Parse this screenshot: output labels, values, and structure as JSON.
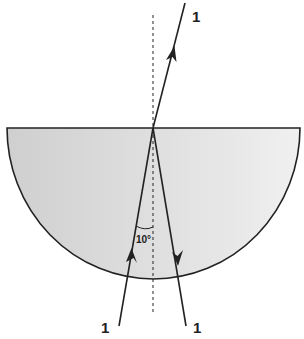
{
  "diagram": {
    "labels": {
      "refracted_ray": "1",
      "incident_ray": "1",
      "reflected_ray": "1",
      "angle": "10°"
    },
    "colors": {
      "block_fill": "#d4d4d4",
      "block_fill_light": "#ececec",
      "line": "#222222"
    }
  }
}
